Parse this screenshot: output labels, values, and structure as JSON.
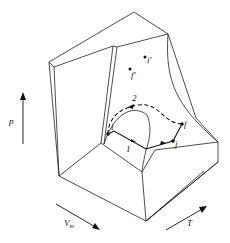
{
  "diagram": {
    "type": "pvt-surface",
    "axes": {
      "p": {
        "label": "p"
      },
      "Vm": {
        "label": "V",
        "subscript": "m"
      },
      "T": {
        "label": "T"
      }
    },
    "points": {
      "i": "i",
      "f": "f",
      "i_prime": "i'",
      "f_prime": "f'",
      "j": "j"
    },
    "paths": {
      "path1": "1",
      "path2": "2"
    }
  }
}
